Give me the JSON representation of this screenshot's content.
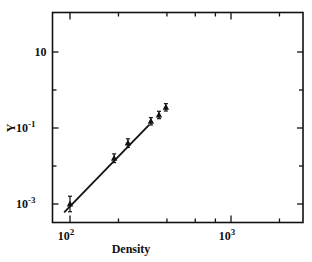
{
  "chart_data": {
    "type": "scatter",
    "title": "",
    "xlabel": "Density",
    "ylabel": "Y",
    "xscale": "log",
    "yscale": "log",
    "xlim": [
      80,
      2800
    ],
    "ylim": [
      0.0003,
      100
    ],
    "grid": false,
    "legend": null,
    "x_ticks": [
      {
        "value": 100,
        "label_base": "10",
        "label_exp": "2"
      },
      {
        "value": 1000,
        "label_base": "10",
        "label_exp": "3"
      }
    ],
    "x_minor_ticks": [
      200,
      400,
      600,
      800,
      2000
    ],
    "y_ticks": [
      {
        "value": 10,
        "label_base": "10",
        "label_exp": ""
      },
      {
        "value": 0.1,
        "label_base": "10",
        "label_exp": "-1"
      },
      {
        "value": 0.001,
        "label_base": "10",
        "label_exp": "-3"
      }
    ],
    "y_minor_ticks": [
      1,
      0.01
    ],
    "series": [
      {
        "name": "data",
        "marker": "triangle",
        "error_bars": true,
        "x": [
          100,
          188,
          229,
          318,
          357,
          394
        ],
        "y": [
          0.001,
          0.016,
          0.04,
          0.15,
          0.22,
          0.35
        ],
        "y_err_factor": [
          1.6,
          1.3,
          1.3,
          1.25,
          1.25,
          1.25
        ]
      },
      {
        "name": "fit",
        "type": "line",
        "x": [
          92,
          310
        ],
        "y": [
          0.0006,
          0.12
        ]
      }
    ]
  }
}
